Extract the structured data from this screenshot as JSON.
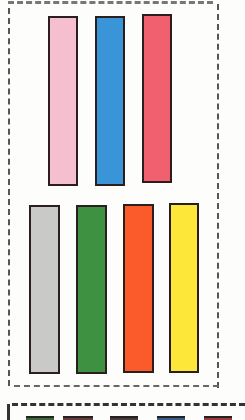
{
  "top_group": {
    "strips": [
      {
        "name": "pink",
        "color": "#f5bfcf",
        "x": 48,
        "y": 16,
        "w": 30,
        "h": 170
      },
      {
        "name": "blue",
        "color": "#3a94d8",
        "x": 95,
        "y": 16,
        "w": 30,
        "h": 170
      },
      {
        "name": "red",
        "color": "#f0606e",
        "x": 142,
        "y": 14,
        "w": 30,
        "h": 169
      }
    ]
  },
  "bottom_group": {
    "strips": [
      {
        "name": "gray",
        "color": "#c9c9c7",
        "x": 29,
        "y": 205,
        "w": 31,
        "h": 169
      },
      {
        "name": "green",
        "color": "#3e9140",
        "x": 76,
        "y": 205,
        "w": 31,
        "h": 169
      },
      {
        "name": "orange",
        "color": "#fb5a2a",
        "x": 123,
        "y": 204,
        "w": 31,
        "h": 169
      },
      {
        "name": "yellow",
        "color": "#fde83a",
        "x": 169,
        "y": 203,
        "w": 30,
        "h": 170
      }
    ]
  },
  "next_box_swatches": [
    {
      "color": "#3e6a3a",
      "x": 26,
      "w": 28
    },
    {
      "color": "#6e3a3a",
      "x": 63,
      "w": 30
    },
    {
      "color": "#4a3a3a",
      "x": 110,
      "w": 28
    },
    {
      "color": "#3a5e8a",
      "x": 157,
      "w": 28
    },
    {
      "color": "#a03a3a",
      "x": 204,
      "w": 28
    }
  ]
}
